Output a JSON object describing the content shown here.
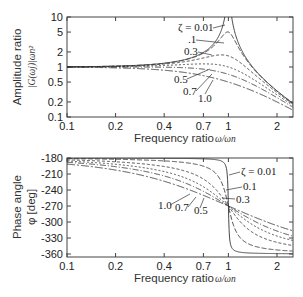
{
  "chart_data": [
    {
      "type": "line",
      "title": "",
      "xlabel": "Frequency ratio ω/ωn",
      "ylabel": "Amplitude ratio |G(ωj)|ωn²",
      "xscale": "log",
      "yscale": "log",
      "xlim": [
        0.1,
        2.5
      ],
      "ylim": [
        0.1,
        10
      ],
      "xticks": [
        "0.1",
        "0.2",
        "0.4",
        "0.7",
        "1",
        "2"
      ],
      "yticks": [
        "0.1",
        "0.2",
        "0.5",
        "1",
        "2",
        "5",
        "10"
      ],
      "grid": false,
      "x": [
        0.1,
        0.2,
        0.4,
        0.7,
        1.0,
        2.0,
        2.5
      ],
      "series": [
        {
          "name": "ζ = 0.01",
          "values": [
            1.01,
            1.04,
            1.19,
            1.96,
            50.0,
            0.33,
            0.19
          ]
        },
        {
          "name": "0.1",
          "values": [
            1.01,
            1.04,
            1.18,
            1.87,
            5.0,
            0.33,
            0.19
          ]
        },
        {
          "name": "0.3",
          "values": [
            1.01,
            1.03,
            1.11,
            1.44,
            1.67,
            0.31,
            0.18
          ]
        },
        {
          "name": "0.5",
          "values": [
            1.0,
            1.02,
            1.04,
            1.07,
            1.0,
            0.28,
            0.17
          ]
        },
        {
          "name": "0.7",
          "values": [
            0.99,
            0.99,
            0.95,
            0.8,
            0.71,
            0.24,
            0.15
          ]
        },
        {
          "name": "1.0",
          "values": [
            0.98,
            0.96,
            0.86,
            0.67,
            0.5,
            0.2,
            0.14
          ]
        }
      ],
      "annotations": [
        "ζ = 0.01",
        ".1",
        "0.3",
        "0.5",
        "0.7",
        "1.0"
      ]
    },
    {
      "type": "line",
      "title": "",
      "xlabel": "Frequency ratio ω/ωn",
      "ylabel": "Phase angle φ [deg]",
      "xscale": "log",
      "xlim": [
        0.1,
        2.5
      ],
      "ylim": [
        -365,
        -178
      ],
      "xticks": [
        "0.1",
        "0.2",
        "0.4",
        "0.7",
        "1",
        "2"
      ],
      "yticks": [
        "-180",
        "-210",
        "-240",
        "-270",
        "-300",
        "-330",
        "-360"
      ],
      "grid": false,
      "x": [
        0.1,
        0.2,
        0.4,
        0.7,
        1.0,
        2.0,
        2.5
      ],
      "series": [
        {
          "name": "ζ = 0.01",
          "values": [
            -180.1,
            -180.2,
            -180.5,
            -181.1,
            -270,
            -359.2,
            -359.5
          ]
        },
        {
          "name": "0.1",
          "values": [
            -181.2,
            -182.4,
            -185.4,
            -195.3,
            -270,
            -352.4,
            -354.5
          ]
        },
        {
          "name": "0.3",
          "values": [
            -183.5,
            -187.1,
            -195.9,
            -219.5,
            -270,
            -338.2,
            -344.8
          ]
        },
        {
          "name": "0.5",
          "values": [
            -185.8,
            -191.8,
            -205.5,
            -233.8,
            -270,
            -326.3,
            -335.7
          ]
        },
        {
          "name": "0.7",
          "values": [
            -188.1,
            -196.3,
            -213.7,
            -243.9,
            -270,
            -317.0,
            -328.2
          ]
        },
        {
          "name": "1.0",
          "values": [
            -191.4,
            -202.6,
            -223.6,
            -254.7,
            -270,
            -306.9,
            -316.4
          ]
        }
      ],
      "annotations": [
        "ζ = 0.01",
        "0.1",
        "0.3",
        "1.0",
        "0.7",
        "0.5"
      ]
    }
  ],
  "labels": {
    "top_ylabel_1": "Amplitude ratio",
    "top_ylabel_2": "|G(ωj)|ωn²",
    "bottom_ylabel_1": "Phase angle",
    "bottom_ylabel_2": "φ [deg]",
    "xlabel_text": "Frequency ratio",
    "xlabel_math": "ω/ωn"
  },
  "damping": [
    0.01,
    0.1,
    0.3,
    0.5,
    0.7,
    1.0
  ],
  "dash": [
    "",
    "5,2",
    "3,2",
    "2,2",
    "6,2,1,2",
    "8,2,2,2"
  ]
}
